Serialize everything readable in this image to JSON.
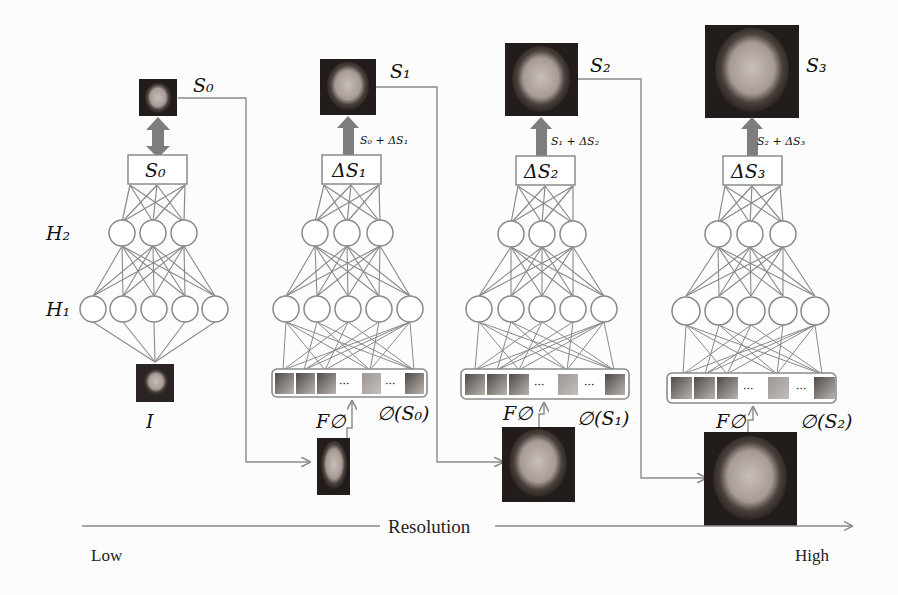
{
  "figure": {
    "stages": [
      {
        "id": "stage0",
        "box_label": "S₀",
        "output_label": "S₀",
        "update_formula": "",
        "input_label": "I",
        "hidden_layer_labels": [
          "H₂",
          "H₁"
        ],
        "h1_nodes": 5,
        "h2_nodes": 3
      },
      {
        "id": "stage1",
        "box_label": "ΔS₁",
        "output_label": "S₁",
        "update_formula": "S₀ + ΔS₁",
        "feature_label": "F∅",
        "phi_label": "∅(S₀)",
        "h1_nodes": 5,
        "h2_nodes": 3
      },
      {
        "id": "stage2",
        "box_label": "ΔS₂",
        "output_label": "S₂",
        "update_formula": "S₁ + ΔS₂",
        "feature_label": "F∅",
        "phi_label": "∅(S₁)",
        "h1_nodes": 5,
        "h2_nodes": 3
      },
      {
        "id": "stage3",
        "box_label": "ΔS₃",
        "output_label": "S₃",
        "update_formula": "S₂ + ΔS₃",
        "feature_label": "F∅",
        "phi_label": "∅(S₂)",
        "h1_nodes": 5,
        "h2_nodes": 3
      }
    ],
    "ellipsis": "···",
    "axis": {
      "label": "Resolution",
      "low": "Low",
      "high": "High"
    },
    "colors": {
      "line": "#8a8a8a",
      "arrow_fill": "#7d7d7d",
      "face_dark": "#2a2522",
      "face_skin": "#b7aca6",
      "landmark": "#d8d0cc",
      "background": "#fcfcfc"
    }
  }
}
